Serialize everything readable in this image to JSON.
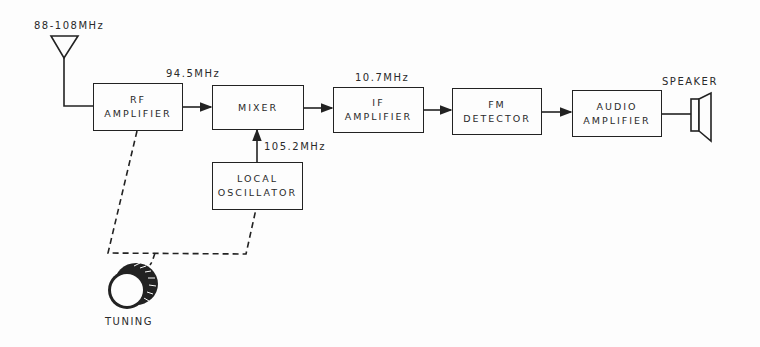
{
  "diagram": {
    "type": "block-diagram",
    "antenna_label": "88-108MHz",
    "blocks": [
      {
        "id": "rf",
        "line1": "RF",
        "line2": "AMPLIFIER"
      },
      {
        "id": "mixer",
        "line1": "MIXER",
        "line2": ""
      },
      {
        "id": "lo",
        "line1": "LOCAL",
        "line2": "OSCILLATOR"
      },
      {
        "id": "if",
        "line1": "IF",
        "line2": "AMPLIFIER"
      },
      {
        "id": "fm",
        "line1": "FM",
        "line2": "DETECTOR"
      },
      {
        "id": "audio",
        "line1": "AUDIO",
        "line2": "AMPLIFIER"
      }
    ],
    "frequency_labels": {
      "rf_to_mixer": "94.5MHz",
      "lo_to_mixer": "105.2MHz",
      "mixer_to_if": "10.7MHz"
    },
    "speaker_label": "SPEAKER",
    "tuning_label": "TUNING",
    "colors": {
      "line": "#222222",
      "background": "#fdfdfd"
    }
  }
}
